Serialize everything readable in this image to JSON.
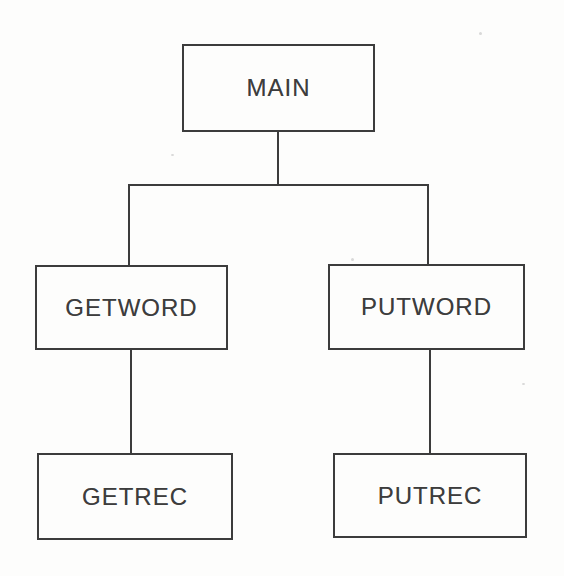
{
  "diagram": {
    "type": "structure-chart",
    "nodes": [
      {
        "id": "main",
        "label": "MAIN"
      },
      {
        "id": "getword",
        "label": "GETWORD"
      },
      {
        "id": "putword",
        "label": "PUTWORD"
      },
      {
        "id": "getrec",
        "label": "GETREC"
      },
      {
        "id": "putrec",
        "label": "PUTREC"
      }
    ],
    "edges": [
      {
        "from": "main",
        "to": "getword"
      },
      {
        "from": "main",
        "to": "putword"
      },
      {
        "from": "getword",
        "to": "getrec"
      },
      {
        "from": "putword",
        "to": "putrec"
      }
    ],
    "colors": {
      "background": "#fdfdfc",
      "line": "#3c3c3c",
      "text": "#3d3d3d"
    }
  }
}
